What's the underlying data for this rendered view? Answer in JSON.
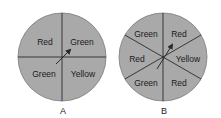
{
  "colors": {
    "disc": "#a9a9a9",
    "line": "#2a2a2a",
    "text": "#1a1a1a",
    "background": "#ffffff"
  },
  "spinners": [
    {
      "caption": "A",
      "sections": 4,
      "labels": [
        "Red",
        "Green",
        "Green",
        "Yellow"
      ],
      "label_positions": [
        "top-left",
        "top-right",
        "bottom-left",
        "bottom-right"
      ]
    },
    {
      "caption": "B",
      "sections": 6,
      "labels": [
        "Green",
        "Red",
        "Red",
        "Yellow",
        "Green",
        "Red"
      ],
      "label_positions": [
        "top-left",
        "top-right",
        "left",
        "right",
        "bottom-left",
        "bottom-right"
      ]
    }
  ]
}
